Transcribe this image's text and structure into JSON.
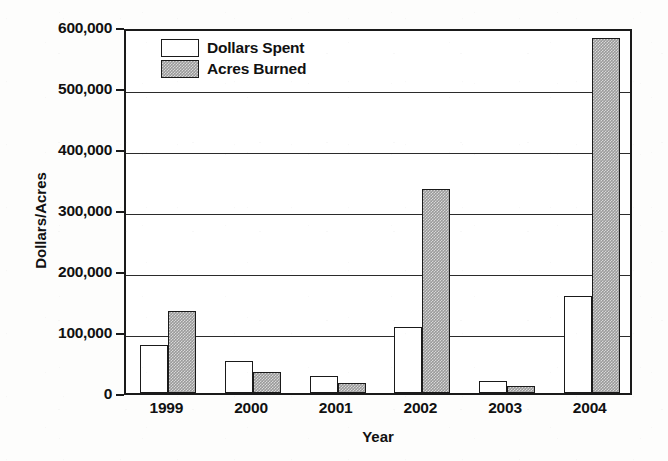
{
  "chart_data": {
    "type": "bar",
    "title": "",
    "xlabel": "Year",
    "ylabel": "Dollars/Acres",
    "categories": [
      "1999",
      "2000",
      "2001",
      "2002",
      "2003",
      "2004"
    ],
    "series": [
      {
        "name": "Dollars Spent",
        "values": [
          79000,
          52000,
          28000,
          108000,
          20000,
          159000
        ],
        "fill": "#ffffff",
        "pattern": "solid-white"
      },
      {
        "name": "Acres Burned",
        "values": [
          134000,
          34000,
          16000,
          334000,
          11000,
          582000
        ],
        "fill": "#9a9a9a",
        "pattern": "dotted-gray"
      }
    ],
    "ylim": [
      0,
      600000
    ],
    "ytick_values": [
      0,
      100000,
      200000,
      300000,
      400000,
      500000,
      600000
    ],
    "ytick_labels": [
      "0",
      "100,000",
      "200,000",
      "300,000",
      "400,000",
      "500,000",
      "600,000"
    ],
    "grid": true,
    "grid_axis": "y",
    "legend_position": "top-left-inside",
    "axis_color": "#1a1a1a",
    "background": "#ffffff"
  },
  "legend": {
    "entries": [
      {
        "label": "Dollars Spent",
        "swatch": "white-square"
      },
      {
        "label": "Acres Burned",
        "swatch": "gray-hatched-square"
      }
    ]
  }
}
